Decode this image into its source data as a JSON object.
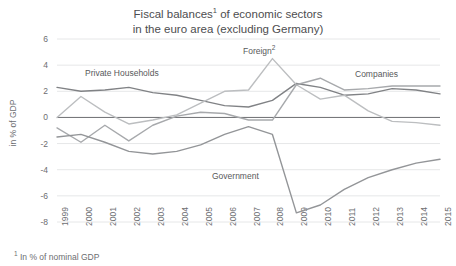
{
  "title": {
    "line1_pre": "Fiscal balances",
    "line1_sup": "1",
    "line1_post": " of economic sectors",
    "line2": "in the euro area (excluding Germany)"
  },
  "footnote": {
    "marker": "1",
    "text": " In % of nominal GDP"
  },
  "axis": {
    "ylabel": "in % of GDP",
    "yticks": [
      "6",
      "4",
      "2",
      "0",
      "-2",
      "-4",
      "-6",
      "-8"
    ],
    "xticks": [
      "1999",
      "2000",
      "2001",
      "2002",
      "2003",
      "2004",
      "2005",
      "2006",
      "2007",
      "2008",
      "2009",
      "2010",
      "2011",
      "2012",
      "2013",
      "2014",
      "2015"
    ]
  },
  "labels": {
    "private_households": "Private Households",
    "foreign_text": "Foreign",
    "foreign_sup": "2",
    "companies": "Companies",
    "government": "Government"
  },
  "colors": {
    "private_households": "#808285",
    "foreign": "#bcbec0",
    "companies": "#a7a9ac",
    "government": "#939598",
    "zero_line": "#6d6e71",
    "grid": "#e6e7e8",
    "text": "#6d6e71"
  },
  "chart_data": {
    "type": "line",
    "xlabel": "",
    "ylabel": "in % of GDP",
    "ylim": [
      -8,
      6
    ],
    "grid": true,
    "legend": "inline-labels",
    "x": [
      1999,
      2000,
      2001,
      2002,
      2003,
      2004,
      2005,
      2006,
      2007,
      2008,
      2009,
      2010,
      2011,
      2012,
      2013,
      2014,
      2015
    ],
    "series": [
      {
        "name": "Private Households",
        "values": [
          2.3,
          2.0,
          2.1,
          2.3,
          1.9,
          1.7,
          1.3,
          0.9,
          0.8,
          1.3,
          2.6,
          2.3,
          1.7,
          1.8,
          2.2,
          2.1,
          1.8
        ]
      },
      {
        "name": "Foreign",
        "values": [
          0.0,
          1.6,
          0.4,
          -0.5,
          -0.2,
          0.2,
          1.1,
          2.0,
          2.1,
          4.5,
          2.5,
          1.4,
          1.7,
          0.5,
          -0.3,
          -0.4,
          -0.6
        ]
      },
      {
        "name": "Companies",
        "values": [
          -0.8,
          -1.9,
          -0.6,
          -1.8,
          -0.6,
          0.1,
          0.4,
          0.3,
          -0.2,
          -0.2,
          2.5,
          3.0,
          2.1,
          2.2,
          2.4,
          2.4,
          2.4
        ]
      },
      {
        "name": "Government",
        "values": [
          -1.5,
          -1.3,
          -1.9,
          -2.6,
          -2.8,
          -2.6,
          -2.1,
          -1.3,
          -0.7,
          -1.3,
          -7.3,
          -6.7,
          -5.5,
          -4.6,
          -4.0,
          -3.5,
          -3.2
        ]
      }
    ]
  }
}
